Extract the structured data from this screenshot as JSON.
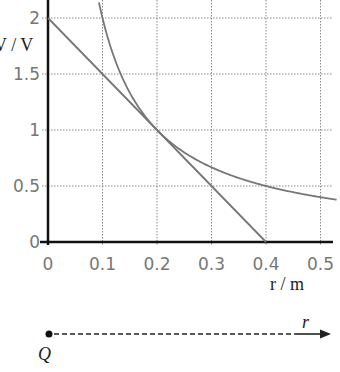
{
  "chart_data": {
    "type": "line",
    "title": "",
    "xlabel": "r / m",
    "ylabel": "V / V",
    "xlim": [
      0,
      0.53
    ],
    "ylim": [
      0,
      2.1
    ],
    "xticks": [
      "0",
      "0.1",
      "0.2",
      "0.3",
      "0.4",
      "0.5"
    ],
    "yticks": [
      "0",
      "0.5",
      "1",
      "1.5",
      "2"
    ],
    "grid": true,
    "legend": null,
    "series": [
      {
        "name": "curve V = 0.2/r",
        "kind": "curve",
        "x": [
          0.1,
          0.125,
          0.15,
          0.2,
          0.25,
          0.3,
          0.4,
          0.5,
          0.53
        ],
        "y": [
          2.0,
          1.6,
          1.33,
          1.0,
          0.8,
          0.67,
          0.5,
          0.4,
          0.38
        ]
      },
      {
        "name": "straight line",
        "kind": "line",
        "x": [
          0,
          0.1,
          0.2,
          0.3,
          0.4
        ],
        "y": [
          2.0,
          1.5,
          1.0,
          0.5,
          0.0
        ]
      }
    ]
  },
  "labels": {
    "x_axis": "r / m",
    "y_axis": "V / V",
    "x_ticks": [
      "0",
      "0.1",
      "0.2",
      "0.3",
      "0.4",
      "0.5"
    ],
    "y_ticks": [
      "0",
      "0.5",
      "1",
      "1.5",
      "2"
    ]
  },
  "diagram": {
    "charge_label": "Q",
    "direction_label": "r"
  }
}
